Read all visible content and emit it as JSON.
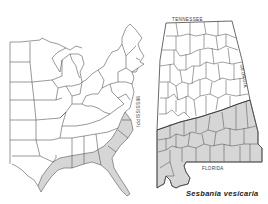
{
  "figure": {
    "caption": "Sesbania vesicaria",
    "colors": {
      "background": "#ffffff",
      "border": "#444444",
      "distribution_fill": "#d6d6d6"
    }
  },
  "regional_map": {
    "description": "Eastern United States outline map with shaded range along the Gulf and Atlantic coastal plain",
    "shaded_region": "Coastal plain from eastern Texas through Louisiana, Mississippi, Alabama, Georgia, Florida, South Carolina to North Carolina"
  },
  "state_map": {
    "description": "Alabama county map with shaded southern counties",
    "labels": {
      "north": "TENNESSEE",
      "west": "MISSISSIPPI",
      "east": "GEORGIA",
      "south": "FLORIDA"
    },
    "shaded_region": "Southern Alabama counties (coastal plain)"
  }
}
